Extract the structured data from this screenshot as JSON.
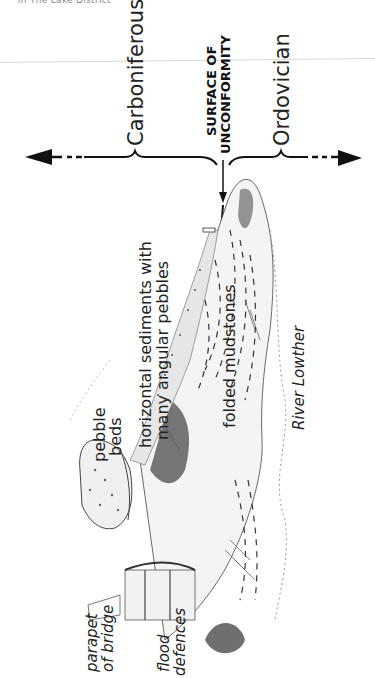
{
  "page_header": "in The Lake District",
  "periods": {
    "left": "Carboniferous",
    "right": "Ordovician"
  },
  "boundary": {
    "line1": "SURFACE OF",
    "line2": "UNCONFORMITY"
  },
  "labels": {
    "horizontal_line1": "horizontal sediments with",
    "horizontal_line2": "many angular pebbles",
    "pebble_line1": "pebble",
    "pebble_line2": "beds",
    "folded": "folded mudstones",
    "river": "River Lowther",
    "parapet_line1": "parapet",
    "parapet_line2": "of bridge",
    "flood_line1": "flood",
    "flood_line2": "defences"
  },
  "icons": {
    "left_arrow": "arrow-left-dashed",
    "right_arrow": "arrow-right-dashed",
    "down_arrow": "arrow-down"
  }
}
